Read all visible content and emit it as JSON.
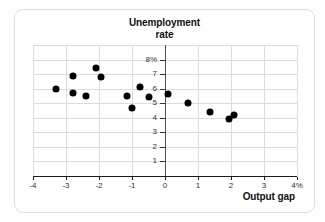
{
  "page": {
    "background": "#fdfdfd"
  },
  "card": {
    "background": "#ffffff",
    "border_color": "#dcdcdc",
    "title_line1": "Unemployment",
    "title_line2": "rate",
    "xaxis_label": "Output gap"
  },
  "chart_data": {
    "type": "scatter",
    "title": "Unemployment rate",
    "xlabel": "Output gap",
    "ylabel": "Unemployment rate",
    "xlim": [
      -4,
      4
    ],
    "ylim": [
      0,
      9
    ],
    "grid": true,
    "legend": "none",
    "x_ticks": [
      {
        "v": -4,
        "label": "-4"
      },
      {
        "v": -3,
        "label": "-3"
      },
      {
        "v": -2,
        "label": "-2"
      },
      {
        "v": -1,
        "label": "-1"
      },
      {
        "v": 0,
        "label": "0"
      },
      {
        "v": 1,
        "label": "1"
      },
      {
        "v": 2,
        "label": "2"
      },
      {
        "v": 3,
        "label": "3"
      },
      {
        "v": 4,
        "label": "4%"
      }
    ],
    "y_ticks": [
      {
        "v": 8,
        "label": "8%"
      },
      {
        "v": 7,
        "label": "7"
      },
      {
        "v": 6,
        "label": "6"
      },
      {
        "v": 5,
        "label": "5"
      },
      {
        "v": 4,
        "label": "4"
      },
      {
        "v": 3,
        "label": "3"
      },
      {
        "v": 2,
        "label": "2"
      },
      {
        "v": 1,
        "label": "1"
      }
    ],
    "y_gridlines": [
      1,
      2,
      3,
      4,
      5,
      6,
      7,
      8,
      9
    ],
    "points": [
      [
        -3.3,
        6.0
      ],
      [
        -2.8,
        6.9
      ],
      [
        -2.8,
        5.7
      ],
      [
        -2.4,
        5.5
      ],
      [
        -2.1,
        7.4
      ],
      [
        -1.95,
        6.8
      ],
      [
        -1.15,
        5.5
      ],
      [
        -1.0,
        4.7
      ],
      [
        -0.75,
        6.1
      ],
      [
        -0.5,
        5.4
      ],
      [
        0.1,
        5.6
      ],
      [
        0.7,
        5.0
      ],
      [
        1.35,
        4.4
      ],
      [
        1.95,
        3.9
      ],
      [
        2.1,
        4.2
      ]
    ],
    "colors": {
      "dot": "#000000",
      "grid": "#dcdcdc",
      "zero_line": "#4d4d4d",
      "axis": "#1a1a1a",
      "tick_label": "#333333",
      "title": "#111111"
    }
  }
}
